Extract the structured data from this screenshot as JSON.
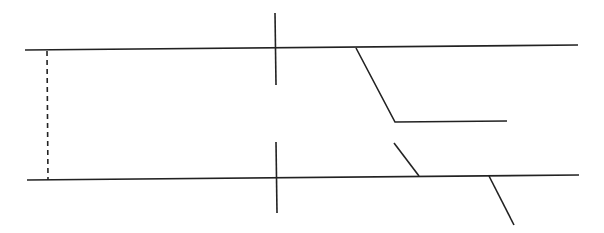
{
  "canvas": {
    "width": 604,
    "height": 233,
    "background": "#ffffff"
  },
  "style": {
    "stroke": "#222222",
    "stroke_width": 1.6,
    "dash_pattern": "5,4"
  },
  "lines": [
    {
      "id": "top-rail",
      "kind": "solid",
      "points": [
        [
          25,
          50
        ],
        [
          578,
          45
        ]
      ]
    },
    {
      "id": "bottom-rail",
      "kind": "solid",
      "points": [
        [
          27,
          180
        ],
        [
          579,
          175
        ]
      ]
    },
    {
      "id": "left-dashed-link",
      "kind": "dashed",
      "points": [
        [
          47,
          51
        ],
        [
          48,
          180
        ]
      ]
    },
    {
      "id": "upper-vertical-tick",
      "kind": "solid",
      "points": [
        [
          275,
          13
        ],
        [
          276,
          85
        ]
      ]
    },
    {
      "id": "lower-vertical-tick",
      "kind": "solid",
      "points": [
        [
          276,
          142
        ],
        [
          277,
          213
        ]
      ]
    },
    {
      "id": "upper-branch",
      "kind": "solid",
      "points": [
        [
          356,
          48
        ],
        [
          395,
          122
        ],
        [
          507,
          121
        ]
      ]
    },
    {
      "id": "short-diagonal",
      "kind": "solid",
      "points": [
        [
          394,
          143
        ],
        [
          419,
          176
        ]
      ]
    },
    {
      "id": "lower-diagonal",
      "kind": "solid",
      "points": [
        [
          489,
          176
        ],
        [
          514,
          225
        ]
      ]
    }
  ]
}
